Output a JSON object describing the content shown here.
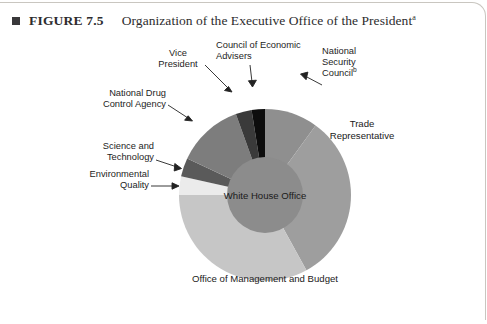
{
  "header": {
    "marker": "square-bullet",
    "figure_number": "FIGURE 7.5",
    "title": "Organization of the Executive Office of the President",
    "title_footnote_marker": "a"
  },
  "chart_data": {
    "type": "pie",
    "title": "Organization of the Executive Office of the President",
    "subtype": "donut-with-center-disc",
    "center_label": "White House Office",
    "legend": "none",
    "grid": false,
    "categories": [
      "National Security Council",
      "Trade Representative",
      "Office of Management and Budget",
      "Environmental Quality",
      "Science and Technology",
      "National Drug Control Agency",
      "Vice President",
      "Council of Economic Advisers"
    ],
    "values": [
      10.0,
      32.0,
      33.0,
      3.5,
      3.5,
      12.5,
      3.0,
      2.5
    ],
    "start_angle_deg": 0,
    "direction": "clockwise",
    "colors": [
      "#8f8f8f",
      "#9e9e9e",
      "#c6c6c6",
      "#ebebeb",
      "#5a5a5a",
      "#7d7d7d",
      "#3a3a3a",
      "#0d0d0d"
    ],
    "center_color": "#8c8c8c",
    "slices": [
      {
        "name": "National Security Council",
        "footnote": "b",
        "value": 10.0,
        "color": "#8f8f8f",
        "label_placement": "callout-top-right"
      },
      {
        "name": "Trade Representative",
        "footnote": "",
        "value": 32.0,
        "color": "#9e9e9e",
        "label_placement": "inside-right"
      },
      {
        "name": "Office of Management and Budget",
        "footnote": "",
        "value": 33.0,
        "color": "#c6c6c6",
        "label_placement": "inside-bottom"
      },
      {
        "name": "Environmental Quality",
        "footnote": "",
        "value": 3.5,
        "color": "#ebebeb",
        "label_placement": "callout-left"
      },
      {
        "name": "Science and Technology",
        "footnote": "",
        "value": 3.5,
        "color": "#5a5a5a",
        "label_placement": "callout-left"
      },
      {
        "name": "National Drug Control Agency",
        "footnote": "",
        "value": 12.5,
        "color": "#7d7d7d",
        "label_placement": "callout-upper-left"
      },
      {
        "name": "Vice President",
        "footnote": "",
        "value": 3.0,
        "color": "#3a3a3a",
        "label_placement": "callout-top-left"
      },
      {
        "name": "Council of Economic Advisers",
        "footnote": "",
        "value": 2.5,
        "color": "#0d0d0d",
        "label_placement": "callout-top"
      }
    ]
  },
  "labels": {
    "vice_president": "Vice President",
    "council_economic_advisers": "Council of Economic\nAdvisers",
    "council_economic_advisers_line1": "Council of Economic",
    "council_economic_advisers_line2": "Advisers",
    "national_security_council_line1": "National",
    "national_security_council_line2": "Security",
    "national_security_council_line3": "Council",
    "national_security_council_footnote": "b",
    "national_drug_line1": "National Drug",
    "national_drug_line2": "Control Agency",
    "science_tech_line1": "Science and",
    "science_tech_line2": "Technology",
    "environmental_line1": "Environmental",
    "environmental_line2": "Quality",
    "trade_rep_line1": "Trade",
    "trade_rep_line2": "Representative",
    "white_house_office": "White House Office",
    "omb": "Office of Management and Budget",
    "vice_president_line1": "Vice",
    "vice_president_line2": "President"
  }
}
